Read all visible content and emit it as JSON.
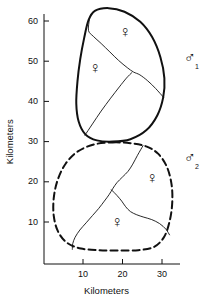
{
  "figure": {
    "type": "territory-map",
    "background_color": "#ffffff",
    "line_color": "#111111"
  },
  "axes": {
    "x": {
      "title": "Kilometers",
      "ticks": [
        10,
        20,
        30
      ],
      "tick_labels": [
        "10",
        "20",
        "30"
      ],
      "range": [
        0,
        35
      ]
    },
    "y": {
      "title": "Kilometers",
      "ticks": [
        10,
        20,
        30,
        40,
        50,
        60
      ],
      "tick_labels": [
        "10",
        "20",
        "30",
        "40",
        "50",
        "60"
      ],
      "range": [
        0,
        65
      ]
    }
  },
  "territories": [
    {
      "id": "male-1",
      "label": "♂",
      "subscript": "1",
      "line_style": "solid",
      "label_position": {
        "x": 184,
        "y": 58
      }
    },
    {
      "id": "male-2",
      "label": "♂",
      "subscript": "2",
      "line_style": "dashed",
      "label_position": {
        "x": 184,
        "y": 158
      }
    }
  ],
  "females": [
    {
      "id": "female-upper-right",
      "label": "♀",
      "position": {
        "x": 125,
        "y": 32
      }
    },
    {
      "id": "female-upper-left",
      "label": "♀",
      "position": {
        "x": 95,
        "y": 68
      }
    },
    {
      "id": "female-lower-right",
      "label": "♀",
      "position": {
        "x": 152,
        "y": 178
      }
    },
    {
      "id": "female-lower-left",
      "label": "♀",
      "position": {
        "x": 117,
        "y": 222
      }
    }
  ],
  "chart_data": {
    "type": "scatter",
    "title": "",
    "xlabel": "Kilometers",
    "ylabel": "Kilometers",
    "xlim": [
      0,
      35
    ],
    "ylim": [
      0,
      65
    ],
    "grid": false,
    "legend": "none",
    "xticks": [
      10,
      20,
      30
    ],
    "yticks": [
      10,
      20,
      30,
      40,
      50,
      60
    ],
    "annotations": [
      {
        "text": "♂1",
        "x": 34.5,
        "y": 50.5,
        "note": "male 1 territory label"
      },
      {
        "text": "♂2",
        "x": 34.5,
        "y": 25.5,
        "note": "male 2 territory label"
      },
      {
        "text": "♀",
        "x": 20.5,
        "y": 56.5,
        "note": "female in male 1 territory, upper right"
      },
      {
        "text": "♀",
        "x": 13.0,
        "y": 47.5,
        "note": "female in male 1 territory, left"
      },
      {
        "text": "♀",
        "x": 27.0,
        "y": 20.0,
        "note": "female in male 2 territory, right"
      },
      {
        "text": "♀",
        "x": 18.5,
        "y": 9.0,
        "note": "female in male 2 territory, lower left"
      }
    ],
    "regions": [
      {
        "name": "male-1-territory",
        "style": "solid",
        "stroke_width": 2,
        "vertices_km": [
          [
            13.0,
            62.5
          ],
          [
            16.5,
            63.2
          ],
          [
            20.5,
            62.3
          ],
          [
            24.5,
            59.8
          ],
          [
            27.5,
            56.0
          ],
          [
            29.6,
            51.0
          ],
          [
            30.6,
            45.8
          ],
          [
            30.3,
            41.0
          ],
          [
            28.8,
            36.5
          ],
          [
            26.0,
            32.8
          ],
          [
            22.0,
            30.6
          ],
          [
            17.5,
            30.0
          ],
          [
            13.5,
            30.3
          ],
          [
            10.6,
            31.8
          ],
          [
            8.9,
            35.0
          ],
          [
            8.3,
            39.5
          ],
          [
            8.6,
            45.0
          ],
          [
            9.3,
            50.5
          ],
          [
            10.3,
            55.8
          ],
          [
            11.4,
            60.2
          ]
        ]
      },
      {
        "name": "male-2-territory",
        "style": "dashed",
        "stroke_width": 2,
        "vertices_km": [
          [
            17.5,
            29.8
          ],
          [
            22.0,
            29.6
          ],
          [
            26.0,
            28.8
          ],
          [
            29.0,
            27.0
          ],
          [
            31.2,
            23.8
          ],
          [
            32.4,
            19.5
          ],
          [
            32.6,
            15.0
          ],
          [
            32.0,
            10.5
          ],
          [
            30.6,
            6.4
          ],
          [
            28.0,
            3.8
          ],
          [
            24.0,
            3.0
          ],
          [
            19.0,
            2.9
          ],
          [
            14.0,
            3.0
          ],
          [
            9.5,
            3.4
          ],
          [
            6.0,
            4.8
          ],
          [
            3.7,
            7.6
          ],
          [
            2.6,
            11.5
          ],
          [
            2.6,
            16.0
          ],
          [
            3.6,
            20.5
          ],
          [
            5.6,
            24.5
          ],
          [
            8.6,
            27.5
          ],
          [
            12.8,
            29.3
          ]
        ]
      }
    ],
    "internal_boundaries": [
      {
        "name": "male-1-divider-a",
        "style": "solid",
        "stroke_width": 0.9,
        "vertices_km": [
          [
            11.6,
            60.3
          ],
          [
            11.4,
            57.6
          ],
          [
            12.6,
            56.2
          ],
          [
            14.6,
            54.4
          ],
          [
            16.8,
            52.3
          ],
          [
            19.0,
            50.2
          ],
          [
            21.2,
            48.4
          ],
          [
            22.8,
            47.3
          ],
          [
            24.4,
            46.6
          ],
          [
            26.4,
            45.1
          ],
          [
            28.4,
            43.2
          ],
          [
            30.4,
            41.0
          ]
        ]
      },
      {
        "name": "male-1-divider-b",
        "style": "solid",
        "stroke_width": 0.9,
        "vertices_km": [
          [
            10.5,
            31.6
          ],
          [
            12.4,
            34.4
          ],
          [
            14.6,
            37.6
          ],
          [
            17.0,
            40.8
          ],
          [
            19.2,
            43.6
          ],
          [
            21.0,
            45.8
          ],
          [
            22.4,
            47.2
          ]
        ]
      },
      {
        "name": "male-2-divider-a",
        "style": "solid",
        "stroke_width": 0.9,
        "vertices_km": [
          [
            25.2,
            29.0
          ],
          [
            23.8,
            26.6
          ],
          [
            22.6,
            24.4
          ],
          [
            21.4,
            22.6
          ],
          [
            20.0,
            21.2
          ],
          [
            18.6,
            19.8
          ],
          [
            17.6,
            18.4
          ],
          [
            16.6,
            16.8
          ],
          [
            15.4,
            15.2
          ],
          [
            14.0,
            13.4
          ],
          [
            12.4,
            11.6
          ],
          [
            10.8,
            9.8
          ],
          [
            9.2,
            8.0
          ],
          [
            8.0,
            6.2
          ],
          [
            7.4,
            4.6
          ],
          [
            7.3,
            3.2
          ]
        ]
      },
      {
        "name": "male-2-divider-b",
        "style": "solid",
        "stroke_width": 0.9,
        "vertices_km": [
          [
            17.2,
            18.0
          ],
          [
            18.6,
            16.6
          ],
          [
            19.8,
            15.2
          ],
          [
            20.8,
            13.8
          ],
          [
            22.0,
            12.6
          ],
          [
            23.6,
            11.8
          ],
          [
            25.4,
            11.2
          ],
          [
            27.4,
            10.6
          ],
          [
            29.4,
            9.6
          ],
          [
            31.0,
            8.2
          ],
          [
            31.9,
            6.8
          ]
        ]
      }
    ]
  }
}
